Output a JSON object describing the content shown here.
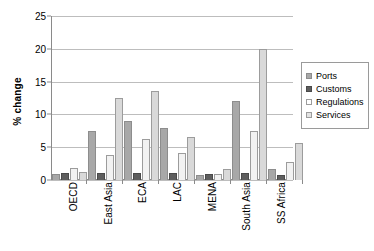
{
  "chart_data": {
    "type": "bar",
    "title": "",
    "subtitle": "",
    "xlabel": "",
    "ylabel": "% change",
    "ylim": [
      0,
      25
    ],
    "yticks": [
      0,
      5,
      10,
      15,
      20,
      25
    ],
    "ytick_labels": [
      "0",
      "5",
      "10",
      "15",
      "20",
      "25"
    ],
    "grid": true,
    "grid_axis": "y",
    "legend_position": "right",
    "categories": [
      "OECD",
      "East Asia",
      "ECA",
      "LAC",
      "MENA",
      "South Asia",
      "SS Africa"
    ],
    "series": [
      {
        "name": "Ports",
        "color": "#a8a8a8",
        "values": [
          0.9,
          7.5,
          9.0,
          8.0,
          0.7,
          12.0,
          1.7
        ]
      },
      {
        "name": "Customs",
        "color": "#5e5e5e",
        "values": [
          1.0,
          1.0,
          1.0,
          1.0,
          0.9,
          1.0,
          0.8
        ]
      },
      {
        "name": "Regulations",
        "color": "#f2f2f2",
        "values": [
          1.8,
          3.8,
          6.3,
          4.1,
          0.9,
          7.5,
          2.8
        ]
      },
      {
        "name": "Services",
        "color": "#d9d9d9",
        "values": [
          1.2,
          12.5,
          13.5,
          6.5,
          1.7,
          20.0,
          5.6
        ]
      }
    ]
  }
}
